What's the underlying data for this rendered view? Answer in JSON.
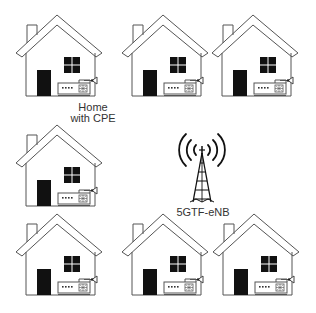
{
  "diagram": {
    "colors": {
      "line": "#555555",
      "fill": "#111111",
      "background": "#ffffff",
      "text": "#333333"
    },
    "base_station": {
      "label": "5GTF-eNB",
      "icon": "radio-tower-icon",
      "position": {
        "x": 202,
        "y": 178
      }
    },
    "home_label": {
      "line1": "Home",
      "line2": "with CPE"
    },
    "homes": [
      {
        "id": "home-1",
        "row": 1,
        "col": 1,
        "icon": "house-with-cpe-icon",
        "labeled": true
      },
      {
        "id": "home-2",
        "row": 1,
        "col": 2,
        "icon": "house-with-cpe-icon",
        "labeled": false
      },
      {
        "id": "home-3",
        "row": 1,
        "col": 3,
        "icon": "house-with-cpe-icon",
        "labeled": false
      },
      {
        "id": "home-4",
        "row": 2,
        "col": 1,
        "icon": "house-with-cpe-icon",
        "labeled": false
      },
      {
        "id": "home-5",
        "row": 3,
        "col": 1,
        "icon": "house-with-cpe-icon",
        "labeled": false
      },
      {
        "id": "home-6",
        "row": 3,
        "col": 2,
        "icon": "house-with-cpe-icon",
        "labeled": false
      },
      {
        "id": "home-7",
        "row": 3,
        "col": 3,
        "icon": "house-with-cpe-icon",
        "labeled": false
      }
    ]
  }
}
